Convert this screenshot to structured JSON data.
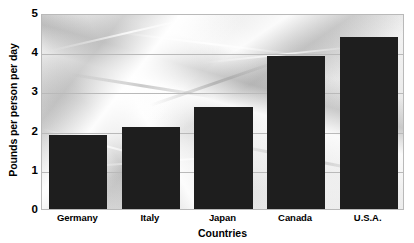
{
  "chart_data": {
    "type": "bar",
    "title": "",
    "subtitle": "",
    "categories": [
      "Germany",
      "Italy",
      "Japan",
      "Canada",
      "U.S.A."
    ],
    "values": [
      1.9,
      2.1,
      2.6,
      3.9,
      4.4
    ],
    "xlabel": "Countries",
    "ylabel": "Pounds per person per day",
    "ylim": [
      0,
      5
    ],
    "yticks": [
      0,
      1,
      2,
      3,
      4,
      5
    ],
    "ytick_labels": [
      "0",
      "1",
      "2",
      "3",
      "4",
      "5"
    ],
    "grid": true,
    "legend": null,
    "legend_position": "none",
    "bar_color": "#1e1e1e",
    "gridline_color": "#b9b9b9",
    "plot_border_color": "#b9b9b9",
    "background_description": "crumpled-plastic-photo-texture"
  },
  "axes": {
    "y_title": "Pounds per person per day",
    "x_title": "Countries"
  }
}
